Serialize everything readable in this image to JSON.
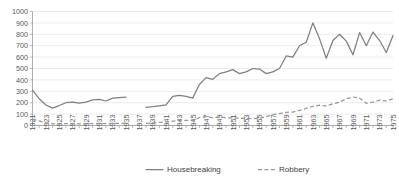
{
  "chart_data": {
    "type": "line",
    "title": "",
    "xlabel": "",
    "ylabel": "",
    "ylim": [
      0,
      1000
    ],
    "ytick_step": 100,
    "yticks": [
      "0",
      "100",
      "200",
      "300",
      "400",
      "500",
      "600",
      "700",
      "800",
      "900",
      "1000"
    ],
    "grid": true,
    "legend_position": "bottom",
    "x": [
      1921,
      1922,
      1923,
      1924,
      1925,
      1926,
      1927,
      1928,
      1929,
      1930,
      1931,
      1932,
      1933,
      1934,
      1935,
      1936,
      1937,
      1938,
      1939,
      1940,
      1941,
      1942,
      1943,
      1944,
      1945,
      1946,
      1947,
      1948,
      1949,
      1950,
      1951,
      1952,
      1953,
      1954,
      1955,
      1956,
      1957,
      1958,
      1959,
      1960,
      1961,
      1962,
      1963,
      1964,
      1965,
      1966,
      1967,
      1968,
      1969,
      1970,
      1971,
      1972,
      1973,
      1974,
      1975
    ],
    "xtick_labels": [
      "1921",
      "1923",
      "1925",
      "1927",
      "1929",
      "1931",
      "1933",
      "1935",
      "1937",
      "1939",
      "1941",
      "1943",
      "1945",
      "1947",
      "1949",
      "1951",
      "1953",
      "1955",
      "1957",
      "1959",
      "1961",
      "1963",
      "1965",
      "1967",
      "1969",
      "1971",
      "1973",
      "1975"
    ],
    "series": [
      {
        "name": "Housebreaking",
        "style": "solid",
        "color": "#7f7f7f",
        "values": [
          310,
          235,
          180,
          152,
          175,
          200,
          205,
          196,
          205,
          225,
          230,
          215,
          240,
          245,
          248,
          null,
          null,
          160,
          165,
          172,
          180,
          255,
          265,
          255,
          240,
          360,
          420,
          405,
          455,
          470,
          490,
          455,
          470,
          500,
          495,
          455,
          470,
          500,
          610,
          600,
          700,
          730,
          900,
          760,
          590,
          745,
          800,
          740,
          620,
          815,
          700,
          820,
          745,
          640,
          790
        ]
      },
      {
        "name": "Robbery",
        "style": "dashed",
        "color": "#9a93a8",
        "values": [
          55,
          40,
          22,
          15,
          14,
          16,
          15,
          14,
          15,
          16,
          18,
          17,
          18,
          19,
          20,
          null,
          null,
          18,
          24,
          28,
          32,
          38,
          42,
          45,
          42,
          70,
          78,
          70,
          72,
          68,
          66,
          64,
          62,
          60,
          62,
          78,
          95,
          105,
          115,
          118,
          132,
          150,
          168,
          178,
          172,
          190,
          205,
          235,
          250,
          240,
          195,
          205,
          222,
          215,
          235
        ]
      }
    ]
  },
  "legend": {
    "items": [
      {
        "label": "Housebreaking",
        "style": "solid",
        "color": "#7f7f7f"
      },
      {
        "label": "Robbery",
        "style": "dashed",
        "color": "#9a93a8"
      }
    ]
  },
  "colors": {
    "housebreaking": "#7f7f7f",
    "robbery": "#9a93a8",
    "gridline": "#e3e3ea",
    "axis": "#9b9b9b",
    "tick_text": "#595959",
    "background": "#ffffff"
  }
}
